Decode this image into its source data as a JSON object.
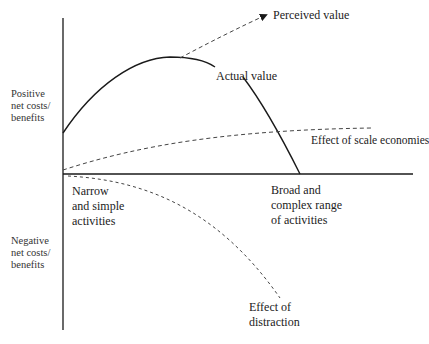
{
  "diagram": {
    "type": "conceptual line diagram",
    "y_axis": {
      "positive_label": "Positive\nnet costs/\nbenefits",
      "negative_label": "Negative\nnet costs/\nbenefits"
    },
    "x_axis": {
      "left_label": "Narrow\nand simple\nactivities",
      "right_label": "Broad and\ncomplex range\nof activities"
    },
    "curves": {
      "perceived_value": "Perceived value",
      "actual_value": "Actual value",
      "scale_economies": "Effect of scale economies",
      "distraction": "Effect of\ndistraction"
    },
    "colors": {
      "line": "#1a1a1a",
      "dashed": "#444444",
      "background": "#ffffff"
    }
  }
}
